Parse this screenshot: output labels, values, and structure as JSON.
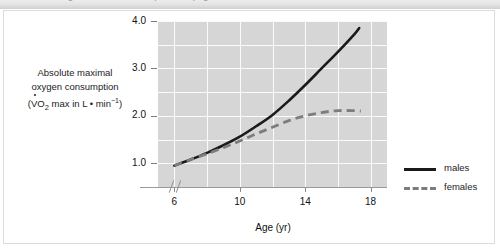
{
  "figure": {
    "top_strip_text": "Figure continued from previous page",
    "background_color": "#ffffff",
    "plot_background_color": "#d6d6d6",
    "gridline_color": "#fbfbfb",
    "border_color": "#dcdcdc"
  },
  "y_axis_title": {
    "line1": "Absolute maximal",
    "line2": "oxygen consumption",
    "line3_prefix": "(",
    "line3_v": "V",
    "line3_o": "O",
    "line3_sub": "2",
    "line3_mid": " max in L • min",
    "line3_sup": "−1",
    "line3_suffix": ")"
  },
  "legend": {
    "position": "right",
    "items": [
      {
        "label": "males",
        "style": "solid",
        "color": "#1a1a1a"
      },
      {
        "label": "females",
        "style": "dashed",
        "color": "#7d7d7d"
      }
    ]
  },
  "chart_data": {
    "type": "line",
    "title": "",
    "subtitle": "",
    "xlabel": "Age (yr)",
    "ylabel": "Absolute maximal oxygen consumption (VO2 max in L • min⁻¹)",
    "xlim": [
      5,
      19
    ],
    "ylim": [
      0.5,
      4.0
    ],
    "xticks": [
      6,
      10,
      14,
      18
    ],
    "xtick_labels": [
      "6",
      "10",
      "14",
      "18"
    ],
    "yticks": [
      1.0,
      2.0,
      3.0,
      4.0
    ],
    "ytick_labels": [
      "1.0",
      "2.0",
      "3.0",
      "4.0"
    ],
    "minor_yticks": [
      1.5,
      2.5,
      3.5
    ],
    "minor_xticks": [
      8,
      12,
      16
    ],
    "grid": true,
    "legend_position": "right",
    "axis_break": "//",
    "annotations": [],
    "series": [
      {
        "name": "males",
        "style": "solid",
        "color": "#1a1a1a",
        "x": [
          6,
          7,
          8,
          9,
          10,
          11,
          12,
          13,
          14,
          15,
          16,
          17,
          17.3
        ],
        "values": [
          0.95,
          1.08,
          1.22,
          1.38,
          1.56,
          1.78,
          2.02,
          2.32,
          2.65,
          3.0,
          3.35,
          3.72,
          3.85
        ]
      },
      {
        "name": "females",
        "style": "dashed",
        "color": "#7d7d7d",
        "x": [
          6,
          7,
          8,
          9,
          10,
          11,
          12,
          13,
          14,
          15,
          16,
          17,
          17.4
        ],
        "values": [
          0.95,
          1.08,
          1.2,
          1.33,
          1.47,
          1.62,
          1.76,
          1.9,
          2.0,
          2.07,
          2.11,
          2.11,
          2.1
        ]
      }
    ]
  }
}
